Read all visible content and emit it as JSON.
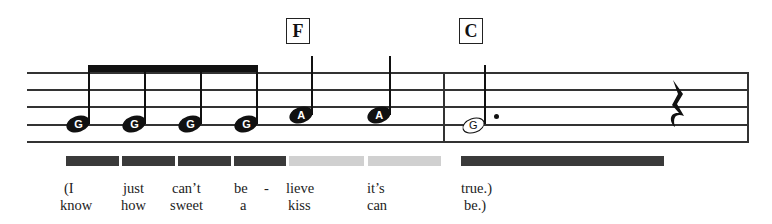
{
  "chords": [
    {
      "label": "F",
      "x": 287
    },
    {
      "label": "C",
      "x": 460
    }
  ],
  "notes": [
    {
      "pitch": "G",
      "type": "eighth",
      "filled": true
    },
    {
      "pitch": "G",
      "type": "eighth",
      "filled": true
    },
    {
      "pitch": "G",
      "type": "eighth",
      "filled": true
    },
    {
      "pitch": "G",
      "type": "eighth",
      "filled": true
    },
    {
      "pitch": "A",
      "type": "quarter",
      "filled": true
    },
    {
      "pitch": "A",
      "type": "quarter",
      "filled": true
    },
    {
      "pitch": "G",
      "type": "dotted-half",
      "filled": false
    },
    {
      "pitch": "",
      "type": "quarter-rest"
    }
  ],
  "duration_bars": [
    {
      "color": "#3a3a3a",
      "shade": "dark"
    },
    {
      "color": "#3a3a3a",
      "shade": "dark"
    },
    {
      "color": "#3a3a3a",
      "shade": "dark"
    },
    {
      "color": "#3a3a3a",
      "shade": "dark"
    },
    {
      "color": "#d0d0d0",
      "shade": "light"
    },
    {
      "color": "#d0d0d0",
      "shade": "light"
    },
    {
      "color": "#3a3a3a",
      "shade": "dark"
    }
  ],
  "lyrics": {
    "line1": [
      "(I",
      "just",
      "can’t",
      "be",
      "-",
      "lieve",
      "it’s",
      "true.)"
    ],
    "line2": [
      "know",
      "how",
      "sweet",
      "a",
      "kiss",
      "can",
      "be.)"
    ]
  }
}
